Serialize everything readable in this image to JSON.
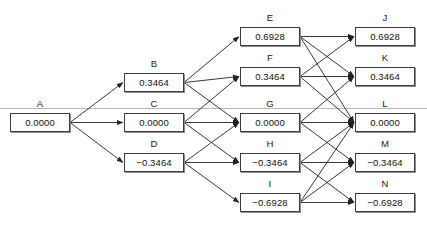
{
  "diagram": {
    "type": "trinomial-tree",
    "guide_line": {
      "y": 108,
      "color": "#b8b8b8"
    },
    "edge_color": "#222222",
    "box_border_color": "#3d3d3d",
    "box_shadow_color": "#8d8d8d",
    "columns": [
      {
        "index": 0,
        "x": 10,
        "width": 60
      },
      {
        "index": 1,
        "x": 124,
        "width": 60
      },
      {
        "index": 2,
        "x": 240,
        "width": 60
      },
      {
        "index": 3,
        "x": 355,
        "width": 60
      }
    ],
    "nodes": [
      {
        "id": "A",
        "label": "A",
        "value": "0.0000",
        "x": 10,
        "y": 113,
        "w": 60,
        "h": 19
      },
      {
        "id": "B",
        "label": "B",
        "value": "0.3464",
        "x": 124,
        "y": 73,
        "w": 60,
        "h": 19
      },
      {
        "id": "C",
        "label": "C",
        "value": "0.0000",
        "x": 124,
        "y": 113,
        "w": 60,
        "h": 19
      },
      {
        "id": "D",
        "label": "D",
        "value": "−0.3464",
        "x": 124,
        "y": 153,
        "w": 60,
        "h": 19
      },
      {
        "id": "E",
        "label": "E",
        "value": "0.6928",
        "x": 240,
        "y": 27,
        "w": 60,
        "h": 19
      },
      {
        "id": "F",
        "label": "F",
        "value": "0.3464",
        "x": 240,
        "y": 67,
        "w": 60,
        "h": 19
      },
      {
        "id": "G",
        "label": "G",
        "value": "0.0000",
        "x": 240,
        "y": 113,
        "w": 60,
        "h": 19
      },
      {
        "id": "H",
        "label": "H",
        "value": "−0.3464",
        "x": 240,
        "y": 153,
        "w": 60,
        "h": 19
      },
      {
        "id": "I",
        "label": "I",
        "value": "−0.6928",
        "x": 240,
        "y": 193,
        "w": 60,
        "h": 19
      },
      {
        "id": "J",
        "label": "J",
        "value": "0.6928",
        "x": 355,
        "y": 27,
        "w": 60,
        "h": 19
      },
      {
        "id": "K",
        "label": "K",
        "value": "0.3464",
        "x": 355,
        "y": 67,
        "w": 60,
        "h": 19
      },
      {
        "id": "L",
        "label": "L",
        "value": "0.0000",
        "x": 355,
        "y": 113,
        "w": 60,
        "h": 19
      },
      {
        "id": "M",
        "label": "M",
        "value": "−0.3464",
        "x": 355,
        "y": 153,
        "w": 60,
        "h": 19
      },
      {
        "id": "N",
        "label": "N",
        "value": "−0.6928",
        "x": 355,
        "y": 193,
        "w": 60,
        "h": 19
      }
    ],
    "edges": [
      {
        "from": "A",
        "to": "B"
      },
      {
        "from": "A",
        "to": "C"
      },
      {
        "from": "A",
        "to": "D"
      },
      {
        "from": "B",
        "to": "E"
      },
      {
        "from": "B",
        "to": "F"
      },
      {
        "from": "B",
        "to": "G"
      },
      {
        "from": "C",
        "to": "F"
      },
      {
        "from": "C",
        "to": "G"
      },
      {
        "from": "C",
        "to": "H"
      },
      {
        "from": "D",
        "to": "G"
      },
      {
        "from": "D",
        "to": "H"
      },
      {
        "from": "D",
        "to": "I"
      },
      {
        "from": "E",
        "to": "J"
      },
      {
        "from": "E",
        "to": "K"
      },
      {
        "from": "E",
        "to": "L"
      },
      {
        "from": "F",
        "to": "J"
      },
      {
        "from": "F",
        "to": "K"
      },
      {
        "from": "F",
        "to": "L"
      },
      {
        "from": "G",
        "to": "K"
      },
      {
        "from": "G",
        "to": "L"
      },
      {
        "from": "G",
        "to": "M"
      },
      {
        "from": "H",
        "to": "L"
      },
      {
        "from": "H",
        "to": "M"
      },
      {
        "from": "H",
        "to": "N"
      },
      {
        "from": "I",
        "to": "L"
      },
      {
        "from": "I",
        "to": "M"
      },
      {
        "from": "I",
        "to": "N"
      }
    ]
  }
}
